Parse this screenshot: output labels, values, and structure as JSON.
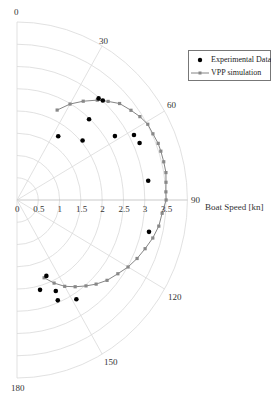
{
  "chart_data": {
    "type": "scatter",
    "subtype": "polar",
    "title": "",
    "radial_label": "Boat Speed [kn]",
    "angle_unit": "degrees",
    "angle_range": [
      0,
      180
    ],
    "angle_ticks": [
      "0",
      "30",
      "60",
      "90",
      "120",
      "150",
      "180"
    ],
    "radial_ticks": [
      "0",
      "0.5",
      "1",
      "1.5",
      "2",
      "2.5",
      "3",
      "3.5"
    ],
    "radial_range": [
      0,
      4
    ],
    "grid": true,
    "legend_position": "upper right",
    "series": [
      {
        "name": "Experimental Data",
        "marker": "filled-circle",
        "line": false,
        "color": "#000000",
        "points": [
          {
            "angle": 34,
            "speed": 1.73
          },
          {
            "angle": 43,
            "speed": 2.48
          },
          {
            "angle": 49,
            "speed": 2.04
          },
          {
            "angle": 40,
            "speed": 2.98
          },
          {
            "angle": 42,
            "speed": 3.01
          },
          {
            "angle": 58,
            "speed": 2.71
          },
          {
            "angle": 62,
            "speed": 3.11
          },
          {
            "angle": 66,
            "speed": 3.15
          },
          {
            "angle": 82,
            "speed": 3.11
          },
          {
            "angle": 103,
            "speed": 3.18
          },
          {
            "angle": 158,
            "speed": 1.84
          },
          {
            "angle": 165,
            "speed": 2.09
          },
          {
            "angle": 156,
            "speed": 2.24
          },
          {
            "angle": 157,
            "speed": 2.45
          },
          {
            "angle": 148,
            "speed": 2.63
          }
        ]
      },
      {
        "name": "VPP simulation",
        "marker": "square",
        "line": true,
        "color": "#777777",
        "points": [
          {
            "angle": 25,
            "speed": 2.23
          },
          {
            "angle": 30,
            "speed": 2.49
          },
          {
            "angle": 35,
            "speed": 2.71
          },
          {
            "angle": 40,
            "speed": 2.93
          },
          {
            "angle": 44,
            "speed": 3.08
          },
          {
            "angle": 48,
            "speed": 3.24
          },
          {
            "angle": 53,
            "speed": 3.35
          },
          {
            "angle": 57,
            "speed": 3.44
          },
          {
            "angle": 61,
            "speed": 3.51
          },
          {
            "angle": 65,
            "speed": 3.52
          },
          {
            "angle": 69,
            "speed": 3.55
          },
          {
            "angle": 72,
            "speed": 3.55
          },
          {
            "angle": 76,
            "speed": 3.55
          },
          {
            "angle": 80,
            "speed": 3.55
          },
          {
            "angle": 83.5,
            "speed": 3.52
          },
          {
            "angle": 87,
            "speed": 3.5
          },
          {
            "angle": 90,
            "speed": 3.5
          },
          {
            "angle": 95,
            "speed": 3.42
          },
          {
            "angle": 100,
            "speed": 3.38
          },
          {
            "angle": 105,
            "speed": 3.3
          },
          {
            "angle": 110,
            "speed": 3.2
          },
          {
            "angle": 115,
            "speed": 3.11
          },
          {
            "angle": 120,
            "speed": 3.01
          },
          {
            "angle": 125,
            "speed": 2.89
          },
          {
            "angle": 130.5,
            "speed": 2.78
          },
          {
            "angle": 135.5,
            "speed": 2.65
          },
          {
            "angle": 140,
            "speed": 2.52
          },
          {
            "angle": 145,
            "speed": 2.38
          },
          {
            "angle": 150,
            "speed": 2.24
          },
          {
            "angle": 155,
            "speed": 2.06
          },
          {
            "angle": 160,
            "speed": 1.86
          }
        ]
      }
    ]
  },
  "legend": {
    "items": [
      {
        "label": "Experimental Data"
      },
      {
        "label": "VPP simulation"
      }
    ]
  },
  "axis": {
    "radial_title": "Boat Speed [kn]"
  },
  "style": {
    "grid_color": "#d9d9d9",
    "exp_color": "#000000",
    "vpp_color": "#777777",
    "vpp_marker_color": "#888888"
  }
}
